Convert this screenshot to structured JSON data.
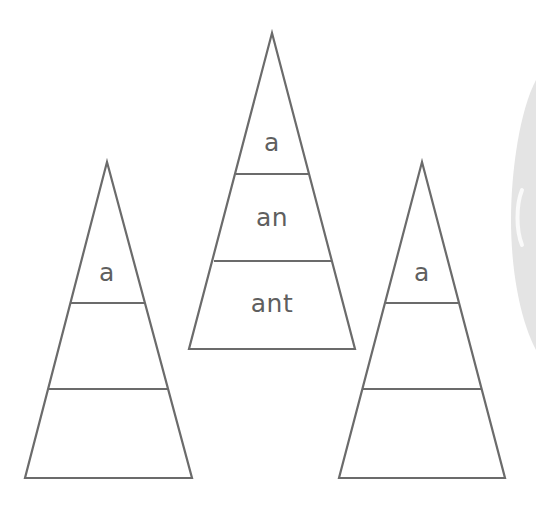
{
  "worksheet": {
    "stroke_color": "#6b6b6b",
    "text_color": "#5f5f5f",
    "pyramids": [
      {
        "id": "left",
        "rows": [
          "a",
          "",
          ""
        ]
      },
      {
        "id": "middle",
        "rows": [
          "a",
          "an",
          "ant"
        ]
      },
      {
        "id": "right",
        "rows": [
          "a",
          "",
          ""
        ]
      }
    ]
  }
}
